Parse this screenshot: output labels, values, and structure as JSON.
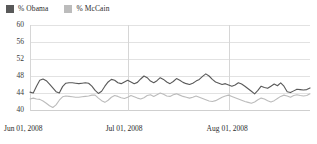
{
  "legend": {
    "position": "top-left",
    "items": [
      {
        "label": "% Obama",
        "color": "#595959",
        "icon": "square-swatch"
      },
      {
        "label": "% McCain",
        "color": "#bcbcbc",
        "icon": "square-swatch"
      }
    ]
  },
  "axes": {
    "y_ticks": [
      "60",
      "56",
      "52",
      "48",
      "44",
      "40"
    ],
    "x_ticks": [
      "Jun 01, 2008",
      "Jul 01, 2008",
      "Aug 01, 2008"
    ]
  },
  "chart_data": {
    "type": "line",
    "title": "",
    "subtitle": "",
    "xlabel": "",
    "ylabel": "",
    "ylim": [
      40,
      60
    ],
    "yticks": [
      40,
      44,
      48,
      52,
      56,
      60
    ],
    "grid": true,
    "legend_position": "top-left",
    "x_tick_labels": [
      "Jun 01, 2008",
      "Jul 01, 2008",
      "Aug 01, 2008"
    ],
    "x_tick_positions": [
      0,
      30,
      61
    ],
    "x_range": [
      0,
      86
    ],
    "x_unit": "days since Jun 01, 2008",
    "series": [
      {
        "name": "% Obama",
        "color": "#595959",
        "values": [
          44.2,
          44.0,
          45.6,
          47.0,
          47.3,
          46.9,
          46.1,
          45.2,
          44.3,
          44.0,
          45.5,
          46.3,
          46.4,
          46.4,
          46.3,
          46.2,
          46.3,
          46.4,
          46.3,
          45.6,
          44.6,
          43.9,
          44.4,
          45.6,
          46.6,
          47.2,
          47.0,
          46.4,
          46.2,
          46.6,
          47.0,
          46.6,
          46.2,
          46.5,
          47.3,
          48.0,
          47.6,
          46.8,
          46.4,
          46.9,
          47.6,
          47.2,
          46.6,
          46.2,
          46.7,
          47.4,
          47.0,
          46.5,
          46.2,
          46.0,
          46.3,
          46.8,
          47.2,
          47.9,
          48.5,
          48.0,
          47.2,
          46.6,
          46.3,
          46.0,
          46.2,
          45.9,
          45.6,
          45.9,
          46.4,
          46.1,
          45.6,
          45.0,
          44.4,
          43.8,
          44.6,
          45.6,
          45.3,
          45.1,
          45.6,
          46.1,
          45.7,
          46.4,
          45.6,
          44.3,
          44.1,
          44.5,
          44.9,
          44.8,
          44.7,
          44.8,
          45.2
        ]
      },
      {
        "name": "% McCain",
        "color": "#bcbcbc",
        "values": [
          42.6,
          42.8,
          42.6,
          42.5,
          42.1,
          41.6,
          41.0,
          40.6,
          41.2,
          42.3,
          43.1,
          43.3,
          43.2,
          43.1,
          43.0,
          43.0,
          43.1,
          43.2,
          43.3,
          43.5,
          43.5,
          42.8,
          42.2,
          41.8,
          42.3,
          43.0,
          43.4,
          43.2,
          42.9,
          42.7,
          43.0,
          43.4,
          43.1,
          42.8,
          42.6,
          42.9,
          43.4,
          43.6,
          43.2,
          43.6,
          44.0,
          43.7,
          43.3,
          43.2,
          43.6,
          43.8,
          43.5,
          43.2,
          43.0,
          42.8,
          43.0,
          43.3,
          43.0,
          42.7,
          42.4,
          42.1,
          42.0,
          42.2,
          42.6,
          43.0,
          43.3,
          43.5,
          43.2,
          42.9,
          42.6,
          42.3,
          42.0,
          41.8,
          41.6,
          41.9,
          42.4,
          42.8,
          42.6,
          42.2,
          41.9,
          42.2,
          42.7,
          43.2,
          43.5,
          43.3,
          43.0,
          43.4,
          43.6,
          43.4,
          43.3,
          43.4,
          43.8
        ]
      }
    ]
  }
}
